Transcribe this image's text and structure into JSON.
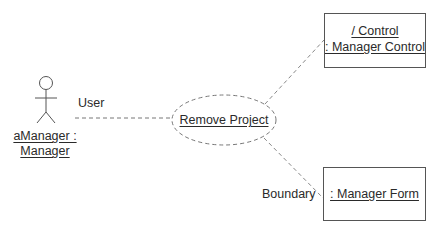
{
  "diagram": {
    "type": "UML collaboration / communication diagram",
    "actor": {
      "name_line1": "aManager :",
      "name_line2": "Manager",
      "association_label": "User"
    },
    "use_case": {
      "label": "Remove Project"
    },
    "control_object": {
      "line1": "/ Control",
      "line2": ": Manager Control"
    },
    "boundary_object": {
      "label": ": Manager Form",
      "association_label": "Boundary"
    },
    "colors": {
      "line": "#555555",
      "text": "#2a2a2a",
      "background": "#ffffff"
    }
  }
}
